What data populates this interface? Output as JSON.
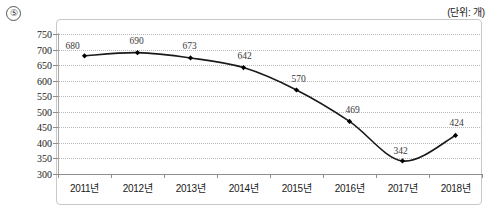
{
  "marker": {
    "label": "⑤"
  },
  "caption": {
    "unit": "(단위: 개)"
  },
  "chart_data": {
    "type": "line",
    "title": "",
    "subtitle": "",
    "xlabel": "",
    "ylabel": "",
    "unit": "(단위: 개)",
    "categories": [
      "2011년",
      "2012년",
      "2013년",
      "2014년",
      "2015년",
      "2016년",
      "2017년",
      "2018년"
    ],
    "values": [
      680,
      690,
      673,
      642,
      570,
      469,
      342,
      424
    ],
    "series": [
      {
        "name": "",
        "values": [
          680,
          690,
          673,
          642,
          570,
          469,
          342,
          424
        ]
      }
    ],
    "point_labels": [
      "680",
      "690",
      "673",
      "642",
      "570",
      "469",
      "342",
      "424"
    ],
    "yticks": [
      300,
      350,
      400,
      450,
      500,
      550,
      600,
      650,
      700,
      750
    ],
    "ytick_labels": [
      "300",
      "350",
      "400",
      "450",
      "500",
      "550",
      "600",
      "650",
      "700",
      "750"
    ],
    "ylim": [
      300,
      750
    ],
    "grid": true,
    "legend": false,
    "legend_position": "none",
    "line_color": "#1a1a1a",
    "marker_shape": "diamond",
    "marker_color": "#000000",
    "grid_color": "#b9b9b9",
    "axis_color": "#8d8d8d"
  }
}
